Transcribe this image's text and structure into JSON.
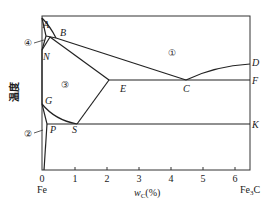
{
  "diagram": {
    "type": "phase-diagram",
    "y_axis_label": "温度",
    "x_axis_label_main": "w",
    "x_axis_label_sub": "C",
    "x_axis_label_unit": "(%)",
    "x_ticks": [
      "0",
      "1",
      "2",
      "3",
      "4",
      "5",
      "6"
    ],
    "x_left_end": "Fe",
    "x_right_end": "Fe",
    "x_right_end_sub": "3",
    "x_right_end_suffix": "C",
    "points": {
      "A": "A",
      "B": "B",
      "N": "N",
      "E": "E",
      "C": "C",
      "D": "D",
      "F": "F",
      "G": "G",
      "P": "P",
      "S": "S",
      "K": "K"
    },
    "regions": {
      "r1": "①",
      "r2": "②",
      "r3": "③",
      "r4": "④"
    }
  }
}
